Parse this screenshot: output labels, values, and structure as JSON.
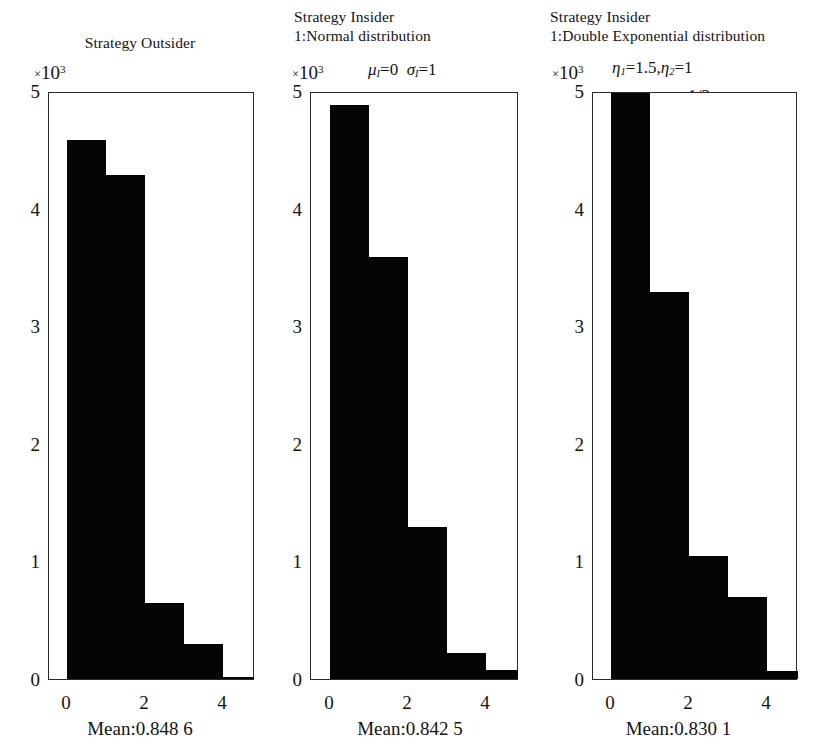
{
  "figure": {
    "background": "#ffffff",
    "ink_color": "#050505"
  },
  "panels": [
    {
      "id": "strategy-outsider",
      "title_lines": [
        "Strategy Outsider"
      ],
      "exponent_label": {
        "times": "×",
        "base": "10",
        "power": "3"
      },
      "params_lines": [],
      "caption": "Mean:0.848 6",
      "chart": {
        "y_ticks": [
          "5",
          "4",
          "3",
          "2",
          "1",
          "0"
        ],
        "x_ticks": [
          "0",
          "2",
          "4"
        ]
      }
    },
    {
      "id": "strategy-insider-normal",
      "title_lines": [
        "Strategy Insider",
        "1:Normal distribution"
      ],
      "exponent_label": {
        "times": "×",
        "base": "10",
        "power": "3"
      },
      "params_lines": [
        "μ_I=0  σ_I=1"
      ],
      "caption": "Mean:0.842 5",
      "chart": {
        "y_ticks": [
          "5",
          "4",
          "3",
          "2",
          "1",
          "0"
        ],
        "x_ticks": [
          "0",
          "2",
          "4"
        ]
      }
    },
    {
      "id": "strategy-insider-double-exponential",
      "title_lines": [
        "Strategy Insider",
        "1:Double Exponential distribution"
      ],
      "exponent_label": {
        "times": "×",
        "base": "10",
        "power": "3"
      },
      "params_lines": [
        "η_1=1.5,η_2=1",
        "p=q=1/2"
      ],
      "caption": "Mean:0.830 1",
      "chart": {
        "y_ticks": [
          "5",
          "4",
          "3",
          "2",
          "1",
          "0"
        ],
        "x_ticks": [
          "0",
          "2",
          "4"
        ]
      }
    }
  ],
  "chart_data": [
    {
      "type": "bar",
      "title": "Strategy Outsider",
      "subtitle": "",
      "xlabel": "",
      "ylabel": "Frequency (×10³)",
      "y_scale_multiplier": 1000,
      "categories": [
        "0–1",
        "1–2",
        "2–3",
        "3–4",
        "4–5"
      ],
      "bin_edges": [
        0,
        1,
        2,
        3,
        4,
        5
      ],
      "values": [
        4.6,
        4.3,
        0.65,
        0.3,
        0.02
      ],
      "xlim": [
        -0.35,
        4.8
      ],
      "ylim": [
        0,
        5
      ],
      "xticks": [
        0,
        2,
        4
      ],
      "yticks": [
        0,
        1,
        2,
        3,
        4,
        5
      ],
      "grid": false,
      "legend": false,
      "annotation": "Mean:0.848 6"
    },
    {
      "type": "bar",
      "title": "Strategy Insider 1:Normal distribution",
      "subtitle": "μ_I=0 σ_I=1",
      "xlabel": "",
      "ylabel": "Frequency (×10³)",
      "y_scale_multiplier": 1000,
      "categories": [
        "0–1",
        "1–2",
        "2–3",
        "3–4",
        "4–5"
      ],
      "bin_edges": [
        0,
        1,
        2,
        3,
        4,
        5
      ],
      "values": [
        4.9,
        3.6,
        1.3,
        0.22,
        0.08
      ],
      "xlim": [
        -0.35,
        4.8
      ],
      "ylim": [
        0,
        5
      ],
      "xticks": [
        0,
        2,
        4
      ],
      "yticks": [
        0,
        1,
        2,
        3,
        4,
        5
      ],
      "grid": false,
      "legend": false,
      "annotation": "Mean:0.842 5"
    },
    {
      "type": "bar",
      "title": "Strategy Insider 1:Double Exponential distribution",
      "subtitle": "η_1=1.5, η_2=1, p=q=1/2",
      "xlabel": "",
      "ylabel": "Frequency (×10³)",
      "y_scale_multiplier": 1000,
      "categories": [
        "0–1",
        "1–2",
        "2–3",
        "3–4",
        "4–5"
      ],
      "bin_edges": [
        0,
        1,
        2,
        3,
        4,
        5
      ],
      "values": [
        5.0,
        3.3,
        1.05,
        0.7,
        0.07
      ],
      "xlim": [
        -0.35,
        4.8
      ],
      "ylim": [
        0,
        5
      ],
      "xticks": [
        0,
        2,
        4
      ],
      "yticks": [
        0,
        1,
        2,
        3,
        4,
        5
      ],
      "grid": false,
      "legend": false,
      "annotation": "Mean:0.830 1"
    }
  ]
}
